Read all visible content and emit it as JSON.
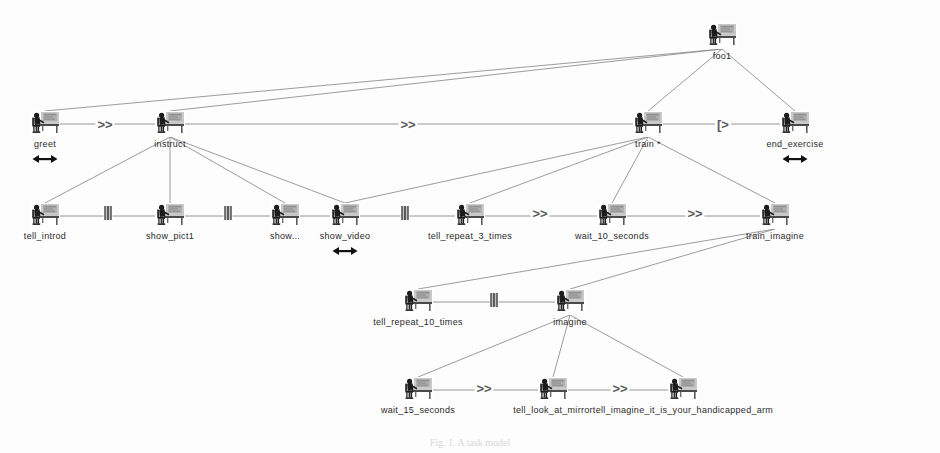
{
  "diagram": {
    "title": "foo1",
    "type": "ConcurTaskTrees task model",
    "background": "#fdfdfd",
    "edge_color": "#8a8a8a",
    "text_color": "#2a2a2a",
    "operator_color": "#5a5a5a",
    "caption": "Fig. 1.  A task model"
  },
  "nodes": [
    {
      "id": "foo1",
      "label": "foo1",
      "x": 722,
      "y": 36,
      "iteration": "",
      "optional": false,
      "label_offset_x": 0
    },
    {
      "id": "greet",
      "label": "greet",
      "x": 45,
      "y": 124,
      "iteration": "",
      "optional": true,
      "label_offset_x": 0
    },
    {
      "id": "instruct",
      "label": "instruct",
      "x": 170,
      "y": 124,
      "iteration": "",
      "optional": false,
      "label_offset_x": 0
    },
    {
      "id": "train",
      "label": "train",
      "x": 648,
      "y": 124,
      "iteration": "*",
      "optional": false,
      "label_offset_x": 0
    },
    {
      "id": "end_exercise",
      "label": "end_exercise",
      "x": 795,
      "y": 124,
      "iteration": "",
      "optional": true,
      "label_offset_x": 0
    },
    {
      "id": "tell_introd",
      "label": "tell_introd",
      "x": 45,
      "y": 216,
      "iteration": "",
      "optional": false,
      "label_offset_x": 0
    },
    {
      "id": "show_pict1",
      "label": "show_pict1",
      "x": 170,
      "y": 216,
      "iteration": "",
      "optional": false,
      "label_offset_x": 0
    },
    {
      "id": "show_dots",
      "label": "show...",
      "x": 285,
      "y": 216,
      "iteration": "",
      "optional": false,
      "label_offset_x": 0
    },
    {
      "id": "show_video",
      "label": "show_video",
      "x": 345,
      "y": 216,
      "iteration": "",
      "optional": true,
      "label_offset_x": 0
    },
    {
      "id": "tell_repeat_3_times",
      "label": "tell_repeat_3_times",
      "x": 470,
      "y": 216,
      "iteration": "",
      "optional": false,
      "label_offset_x": 0
    },
    {
      "id": "wait_10_seconds",
      "label": "wait_10_seconds",
      "x": 612,
      "y": 216,
      "iteration": "",
      "optional": false,
      "label_offset_x": 0
    },
    {
      "id": "train_imagine",
      "label": "train_imagine",
      "x": 775,
      "y": 216,
      "iteration": "",
      "optional": false,
      "label_offset_x": 0
    },
    {
      "id": "tell_repeat_10_times",
      "label": "tell_repeat_10_times",
      "x": 418,
      "y": 302,
      "iteration": "",
      "optional": false,
      "label_offset_x": 0
    },
    {
      "id": "imagine",
      "label": "imagine",
      "x": 570,
      "y": 302,
      "iteration": "",
      "optional": false,
      "label_offset_x": 0
    },
    {
      "id": "wait_15_seconds",
      "label": "wait_15_seconds",
      "x": 418,
      "y": 390,
      "iteration": "",
      "optional": false,
      "label_offset_x": 0
    },
    {
      "id": "tell_look_at_mirror",
      "label": "tell_look_at_mirror",
      "x": 553,
      "y": 390,
      "iteration": "",
      "optional": false,
      "label_offset_x": 0
    },
    {
      "id": "tell_imagine_arm",
      "label": "tell_imagine_it_is_your_handicapped_arm",
      "x": 683,
      "y": 390,
      "iteration": "",
      "optional": false,
      "label_offset_x": 0
    }
  ],
  "hierarchy_edges": [
    {
      "from": "foo1",
      "to": "greet"
    },
    {
      "from": "foo1",
      "to": "instruct"
    },
    {
      "from": "foo1",
      "to": "train"
    },
    {
      "from": "foo1",
      "to": "end_exercise"
    },
    {
      "from": "instruct",
      "to": "tell_introd"
    },
    {
      "from": "instruct",
      "to": "show_pict1"
    },
    {
      "from": "instruct",
      "to": "show_dots"
    },
    {
      "from": "instruct",
      "to": "show_video"
    },
    {
      "from": "train",
      "to": "show_video"
    },
    {
      "from": "train",
      "to": "tell_repeat_3_times"
    },
    {
      "from": "train",
      "to": "wait_10_seconds"
    },
    {
      "from": "train",
      "to": "train_imagine"
    },
    {
      "from": "train_imagine",
      "to": "tell_repeat_10_times"
    },
    {
      "from": "train_imagine",
      "to": "imagine"
    },
    {
      "from": "imagine",
      "to": "wait_15_seconds"
    },
    {
      "from": "imagine",
      "to": "tell_look_at_mirror"
    },
    {
      "from": "imagine",
      "to": "tell_imagine_arm"
    }
  ],
  "sibling_links": [
    {
      "from": "greet",
      "to": "instruct"
    },
    {
      "from": "instruct",
      "to": "train"
    },
    {
      "from": "train",
      "to": "end_exercise"
    },
    {
      "from": "tell_introd",
      "to": "show_pict1"
    },
    {
      "from": "show_pict1",
      "to": "show_dots"
    },
    {
      "from": "show_dots",
      "to": "show_video"
    },
    {
      "from": "show_video",
      "to": "tell_repeat_3_times"
    },
    {
      "from": "tell_repeat_3_times",
      "to": "wait_10_seconds"
    },
    {
      "from": "wait_10_seconds",
      "to": "train_imagine"
    },
    {
      "from": "tell_repeat_10_times",
      "to": "imagine"
    },
    {
      "from": "wait_15_seconds",
      "to": "tell_look_at_mirror"
    },
    {
      "from": "tell_look_at_mirror",
      "to": "tell_imagine_arm"
    }
  ],
  "operators": [
    {
      "id": "op1",
      "symbol": ">>",
      "kind": "enabling",
      "x": 105,
      "y": 124
    },
    {
      "id": "op2",
      "symbol": ">>",
      "kind": "enabling",
      "x": 408,
      "y": 124
    },
    {
      "id": "op3",
      "symbol": "[>",
      "kind": "disabling",
      "x": 723,
      "y": 124
    },
    {
      "id": "op4",
      "symbol": "|||",
      "kind": "concurrent",
      "x": 108,
      "y": 213
    },
    {
      "id": "op5",
      "symbol": "|||",
      "kind": "concurrent",
      "x": 228,
      "y": 213
    },
    {
      "id": "op6",
      "symbol": "|||",
      "kind": "concurrent",
      "x": 405,
      "y": 213
    },
    {
      "id": "op7",
      "symbol": ">>",
      "kind": "enabling",
      "x": 540,
      "y": 213
    },
    {
      "id": "op8",
      "symbol": ">>",
      "kind": "enabling",
      "x": 695,
      "y": 213
    },
    {
      "id": "op9",
      "symbol": "|||",
      "kind": "concurrent",
      "x": 494,
      "y": 300
    },
    {
      "id": "op10",
      "symbol": ">>",
      "kind": "enabling",
      "x": 484,
      "y": 388
    },
    {
      "id": "op11",
      "symbol": ">>",
      "kind": "enabling",
      "x": 620,
      "y": 388
    }
  ],
  "legend": {
    "enabling": ">>",
    "concurrent": "|||",
    "disabling": "[>",
    "iteration": "*",
    "optional_marker": "optional-double-arrow"
  }
}
